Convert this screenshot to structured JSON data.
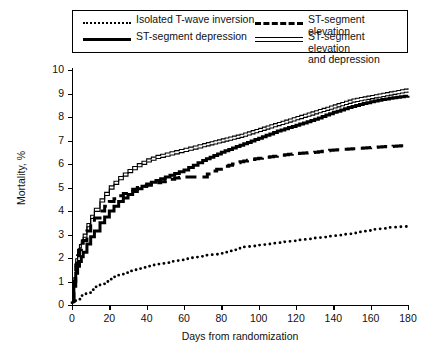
{
  "figure": {
    "background": "#ffffff",
    "ink_color": "#000000"
  },
  "legend": {
    "position": "top",
    "border": true,
    "entries": [
      {
        "label": "Isolated T-wave inversion",
        "style": "dotted",
        "icon": "dotted-line-swatch"
      },
      {
        "label": "ST-segment elevation",
        "style": "dashed",
        "icon": "dashed-line-swatch"
      },
      {
        "label": "ST-segment depression",
        "style": "solid",
        "icon": "solid-line-swatch"
      },
      {
        "label": "ST-segment elevation\nand depression",
        "style": "double",
        "icon": "double-line-swatch"
      }
    ]
  },
  "chart_data": {
    "type": "line",
    "title": "",
    "subtitle": "",
    "xlabel": "Days from randomization",
    "ylabel": "Mortality, %",
    "xlim": [
      0,
      180
    ],
    "ylim": [
      0,
      10
    ],
    "xticks": [
      0,
      20,
      40,
      60,
      80,
      100,
      120,
      140,
      160,
      180
    ],
    "yticks": [
      0,
      1,
      2,
      3,
      4,
      5,
      6,
      7,
      8,
      9,
      10
    ],
    "grid": false,
    "legend_position": "top",
    "series": [
      {
        "name": "ST-segment elevation and depression",
        "style": "double",
        "x": [
          0,
          1,
          2,
          3,
          4,
          5,
          6,
          8,
          10,
          12,
          15,
          20,
          25,
          30,
          35,
          40,
          45,
          50,
          55,
          60,
          65,
          70,
          80,
          90,
          100,
          110,
          120,
          130,
          140,
          150,
          160,
          170,
          180
        ],
        "y": [
          0.15,
          1.1,
          1.9,
          2.3,
          2.5,
          2.7,
          2.95,
          3.4,
          3.75,
          4.05,
          4.45,
          5.0,
          5.4,
          5.7,
          5.95,
          6.15,
          6.3,
          6.4,
          6.5,
          6.6,
          6.7,
          6.8,
          7.0,
          7.2,
          7.45,
          7.7,
          7.95,
          8.2,
          8.45,
          8.7,
          8.85,
          9.0,
          9.15
        ]
      },
      {
        "name": "ST-segment depression",
        "style": "solid",
        "x": [
          0,
          1,
          2,
          3,
          4,
          5,
          6,
          8,
          10,
          12,
          15,
          20,
          25,
          30,
          35,
          40,
          45,
          50,
          55,
          60,
          65,
          70,
          80,
          90,
          100,
          110,
          120,
          130,
          140,
          150,
          160,
          170,
          180
        ],
        "y": [
          0.15,
          0.8,
          1.35,
          1.65,
          1.85,
          2.05,
          2.25,
          2.6,
          2.9,
          3.15,
          3.5,
          4.0,
          4.4,
          4.7,
          4.95,
          5.15,
          5.3,
          5.45,
          5.6,
          5.75,
          5.95,
          6.15,
          6.5,
          6.8,
          7.1,
          7.4,
          7.65,
          7.9,
          8.2,
          8.45,
          8.65,
          8.8,
          8.9
        ]
      },
      {
        "name": "ST-segment elevation",
        "style": "dashed",
        "x": [
          0,
          1,
          2,
          3,
          4,
          5,
          6,
          8,
          10,
          12,
          15,
          20,
          25,
          30,
          35,
          40,
          45,
          50,
          55,
          60,
          65,
          70,
          75,
          80,
          90,
          100,
          110,
          120,
          130,
          140,
          150,
          160,
          170,
          180
        ],
        "y": [
          0.15,
          1.0,
          1.7,
          2.1,
          2.35,
          2.55,
          2.75,
          3.15,
          3.45,
          3.7,
          4.0,
          4.4,
          4.65,
          4.85,
          5.0,
          5.1,
          5.2,
          5.3,
          5.4,
          5.45,
          5.45,
          5.45,
          5.7,
          5.85,
          6.1,
          6.25,
          6.35,
          6.45,
          6.5,
          6.6,
          6.65,
          6.7,
          6.75,
          6.8
        ]
      },
      {
        "name": "Isolated T-wave inversion",
        "style": "dotted",
        "x": [
          0,
          2,
          5,
          10,
          15,
          20,
          25,
          30,
          35,
          40,
          50,
          60,
          70,
          80,
          90,
          100,
          110,
          120,
          130,
          140,
          150,
          160,
          170,
          180
        ],
        "y": [
          0.1,
          0.25,
          0.4,
          0.65,
          0.9,
          1.1,
          1.3,
          1.45,
          1.55,
          1.65,
          1.8,
          1.95,
          2.1,
          2.2,
          2.45,
          2.55,
          2.65,
          2.75,
          2.85,
          2.95,
          3.05,
          3.2,
          3.3,
          3.35
        ]
      }
    ]
  }
}
